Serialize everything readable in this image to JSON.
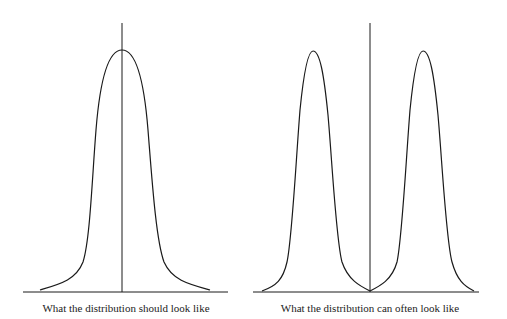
{
  "diagrams": [
    {
      "id": "unimodal",
      "caption": "What the distribution should look like",
      "shape": "single bell curve centered on vertical mean line"
    },
    {
      "id": "bimodal",
      "caption": "What the distribution can often look like",
      "shape": "two bell curves with vertical mean line between them at the trough"
    }
  ],
  "colors": {
    "line": "#1a1a1a",
    "background": "#ffffff"
  }
}
